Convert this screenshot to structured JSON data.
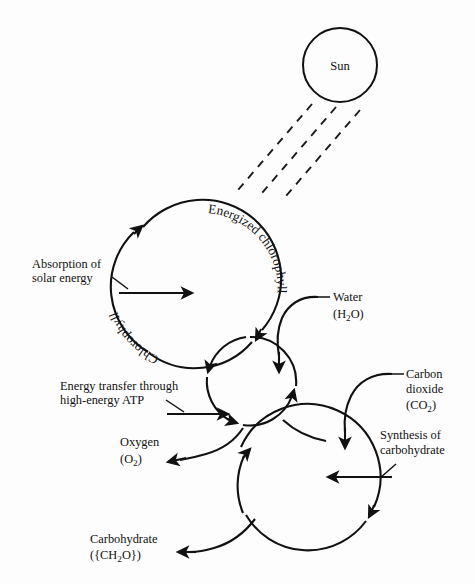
{
  "diagram": {
    "background_color": "#fdfdfd",
    "stroke_color": "#111111",
    "sun": {
      "label": "Sun",
      "rays_count": 3
    },
    "cycles": [
      {
        "id": "chlorophyll-cycle",
        "curved_label_top": "Energized chlorophyll",
        "curved_label_bottom": "Chlorophyll",
        "cx": 189,
        "cy": 286,
        "r": 76
      },
      {
        "id": "water-splitting-cycle",
        "cx": 252,
        "cy": 382,
        "r": 45
      },
      {
        "id": "carbohydrate-synthesis-cycle",
        "cx": 305,
        "cy": 484,
        "r": 72
      }
    ],
    "labels": {
      "absorption": {
        "line1": "Absorption of",
        "line2": "solar energy"
      },
      "energy_transfer": {
        "line1": "Energy transfer through",
        "line2": "high-energy ATP"
      },
      "water": {
        "name": "Water",
        "formula_pre": "(H",
        "formula_sub": "2",
        "formula_post": "O)"
      },
      "carbon_dioxide": {
        "line1": "Carbon",
        "line2": "dioxide",
        "formula_pre": "(CO",
        "formula_sub": "2",
        "formula_post": ")"
      },
      "oxygen": {
        "name": "Oxygen",
        "formula_pre": "(O",
        "formula_sub": "2",
        "formula_post": ")"
      },
      "synthesis": {
        "line1": "Synthesis of",
        "line2": "carbohydrate"
      },
      "carbohydrate": {
        "name": "Carbohydrate",
        "formula_pre": "({CH",
        "formula_sub": "2",
        "formula_post": "O})"
      }
    }
  }
}
